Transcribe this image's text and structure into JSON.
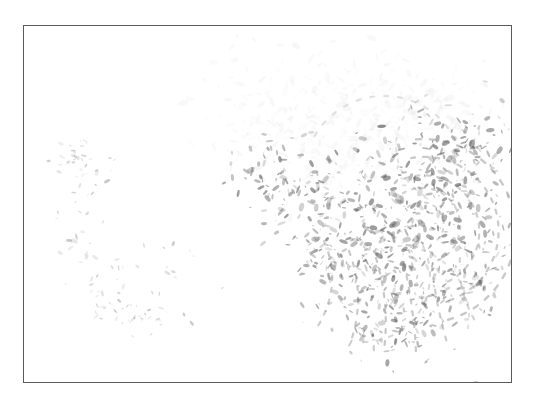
{
  "document": {
    "title": "Latent Fingerprint Impression",
    "kind": "scanned-image",
    "background_color": "#ffffff"
  },
  "frame": {
    "name": "image-border",
    "stroke_color": "#5a5a5e",
    "stroke_width_px": 1,
    "x": 23,
    "y": 25,
    "width": 489,
    "height": 358
  },
  "image_content": {
    "subject": "latent fingerprint ridge impression",
    "condition": "faded, low-contrast, partially developed",
    "ink_color": "#555558",
    "haze_color": "#d8d8dc",
    "coverage_note": "ridge detail concentrated in upper-right and center-right; left side nearly blank",
    "regions": [
      {
        "name": "upper-haze-cloud",
        "description": "diffuse light-gray mottled cloud near top center",
        "center_x": 320,
        "center_y": 95,
        "intensity": "very light"
      },
      {
        "name": "core-ridge-flow",
        "description": "curved arcing ridge fragments forming the print core",
        "center_x": 400,
        "center_y": 200,
        "intensity": "medium"
      },
      {
        "name": "lower-ridge-tails",
        "description": "vertical flowing ridge tails fading downward",
        "center_x": 360,
        "center_y": 285,
        "intensity": "medium-light"
      },
      {
        "name": "left-sparse-marks",
        "description": "isolated faint smudges and short strokes",
        "center_x": 110,
        "center_y": 230,
        "intensity": "very faint"
      }
    ]
  },
  "chart_data": {
    "type": "scatter",
    "xlabel": "",
    "ylabel": "",
    "xlim": [
      0,
      489
    ],
    "ylim": [
      0,
      358
    ],
    "grid": false,
    "legend": "none",
    "seed": 20240517,
    "series": [
      {
        "name": "haze-cloud",
        "color": "#d8d8dc",
        "count": 430,
        "blob_min_px": 3,
        "blob_max_px": 11,
        "opacity_min": 0.05,
        "opacity_max": 0.2,
        "clusters": [
          {
            "cx": 305,
            "cy": 55,
            "rx": 105,
            "ry": 45,
            "weight": 1.1
          },
          {
            "cx": 250,
            "cy": 95,
            "rx": 80,
            "ry": 45,
            "weight": 0.9
          },
          {
            "cx": 360,
            "cy": 100,
            "rx": 85,
            "ry": 45,
            "weight": 0.9
          },
          {
            "cx": 300,
            "cy": 135,
            "rx": 95,
            "ry": 40,
            "weight": 0.7
          },
          {
            "cx": 420,
            "cy": 75,
            "rx": 55,
            "ry": 40,
            "weight": 0.6
          }
        ]
      },
      {
        "name": "core-ridges",
        "color": "#5e5e62",
        "count": 560,
        "blob_min_px": 2,
        "blob_max_px": 9,
        "opacity_min": 0.18,
        "opacity_max": 0.62,
        "clusters": [
          {
            "cx": 390,
            "cy": 150,
            "rx": 75,
            "ry": 55,
            "weight": 1.2
          },
          {
            "cx": 420,
            "cy": 200,
            "rx": 70,
            "ry": 60,
            "weight": 1.3
          },
          {
            "cx": 355,
            "cy": 215,
            "rx": 55,
            "ry": 55,
            "weight": 1.0
          },
          {
            "cx": 300,
            "cy": 175,
            "rx": 60,
            "ry": 45,
            "weight": 0.8
          },
          {
            "cx": 440,
            "cy": 120,
            "rx": 50,
            "ry": 45,
            "weight": 0.9
          },
          {
            "cx": 255,
            "cy": 145,
            "rx": 50,
            "ry": 40,
            "weight": 0.55
          }
        ]
      },
      {
        "name": "ridge-tails",
        "color": "#5a5a5e",
        "count": 330,
        "blob_min_px": 2,
        "blob_max_px": 8,
        "opacity_min": 0.14,
        "opacity_max": 0.55,
        "clusters": [
          {
            "cx": 330,
            "cy": 255,
            "rx": 55,
            "ry": 50,
            "weight": 1.0
          },
          {
            "cx": 400,
            "cy": 270,
            "rx": 60,
            "ry": 55,
            "weight": 1.1
          },
          {
            "cx": 360,
            "cy": 300,
            "rx": 45,
            "ry": 40,
            "weight": 0.7
          },
          {
            "cx": 300,
            "cy": 230,
            "rx": 35,
            "ry": 35,
            "weight": 0.6
          },
          {
            "cx": 440,
            "cy": 245,
            "rx": 45,
            "ry": 45,
            "weight": 0.7
          }
        ]
      },
      {
        "name": "sparse-left-marks",
        "color": "#6a6a6e",
        "count": 120,
        "blob_min_px": 2,
        "blob_max_px": 7,
        "opacity_min": 0.07,
        "opacity_max": 0.35,
        "clusters": [
          {
            "cx": 60,
            "cy": 140,
            "rx": 35,
            "ry": 35,
            "weight": 0.8
          },
          {
            "cx": 80,
            "cy": 250,
            "rx": 45,
            "ry": 30,
            "weight": 0.7
          },
          {
            "cx": 110,
            "cy": 290,
            "rx": 55,
            "ry": 22,
            "weight": 0.8
          },
          {
            "cx": 150,
            "cy": 230,
            "rx": 45,
            "ry": 28,
            "weight": 0.5
          },
          {
            "cx": 55,
            "cy": 200,
            "rx": 30,
            "ry": 30,
            "weight": 0.4
          }
        ]
      }
    ],
    "ridge_arcs": [
      {
        "name": "arc-outer-right",
        "cx": 400,
        "cy": 205,
        "r": 92,
        "a0": -95,
        "a1": 80,
        "color": "#5e5e62",
        "opacity": 0.34,
        "width": 2.4,
        "dash": "5 9"
      },
      {
        "name": "arc-mid-right",
        "cx": 400,
        "cy": 205,
        "r": 74,
        "a0": -100,
        "a1": 75,
        "color": "#5e5e62",
        "opacity": 0.32,
        "width": 2.3,
        "dash": "4 8"
      },
      {
        "name": "arc-inner-right",
        "cx": 400,
        "cy": 205,
        "r": 56,
        "a0": -110,
        "a1": 70,
        "color": "#5e5e62",
        "opacity": 0.3,
        "width": 2.2,
        "dash": "4 7"
      },
      {
        "name": "arc-core-a",
        "cx": 398,
        "cy": 200,
        "r": 38,
        "a0": -120,
        "a1": 65,
        "color": "#5a5a5e",
        "opacity": 0.28,
        "width": 2.1,
        "dash": "3 7"
      },
      {
        "name": "arc-core-b",
        "cx": 398,
        "cy": 198,
        "r": 22,
        "a0": -130,
        "a1": 60,
        "color": "#5a5a5e",
        "opacity": 0.26,
        "width": 2.0,
        "dash": "3 6"
      },
      {
        "name": "arc-upper-sweep",
        "cx": 360,
        "cy": 150,
        "r": 80,
        "a0": -150,
        "a1": -20,
        "color": "#6a6a6e",
        "opacity": 0.2,
        "width": 2.2,
        "dash": "4 10"
      },
      {
        "name": "arc-top-delta",
        "cx": 430,
        "cy": 120,
        "r": 58,
        "a0": 120,
        "a1": 250,
        "color": "#6a6a6e",
        "opacity": 0.2,
        "width": 2.0,
        "dash": "3 8"
      },
      {
        "name": "arc-lower-left",
        "cx": 340,
        "cy": 250,
        "r": 66,
        "a0": -60,
        "a1": 95,
        "color": "#5e5e62",
        "opacity": 0.24,
        "width": 2.1,
        "dash": "4 9"
      },
      {
        "name": "arc-lower-tail",
        "cx": 375,
        "cy": 290,
        "r": 70,
        "a0": -120,
        "a1": 10,
        "color": "#5e5e62",
        "opacity": 0.2,
        "width": 2.0,
        "dash": "3 9"
      }
    ],
    "ridge_tails": [
      {
        "name": "tail-1",
        "x": 300,
        "y": 215,
        "dx": -6,
        "dy": 85,
        "bow": 22,
        "opacity": 0.3
      },
      {
        "name": "tail-2",
        "x": 325,
        "y": 225,
        "dx": 2,
        "dy": 90,
        "bow": 16,
        "opacity": 0.32
      },
      {
        "name": "tail-3",
        "x": 352,
        "y": 232,
        "dx": 8,
        "dy": 92,
        "bow": 10,
        "opacity": 0.34
      },
      {
        "name": "tail-4",
        "x": 380,
        "y": 238,
        "dx": 12,
        "dy": 88,
        "bow": 4,
        "opacity": 0.32
      },
      {
        "name": "tail-5",
        "x": 408,
        "y": 240,
        "dx": 16,
        "dy": 80,
        "bow": -4,
        "opacity": 0.3
      },
      {
        "name": "tail-6",
        "x": 436,
        "y": 232,
        "dx": 18,
        "dy": 68,
        "bow": -12,
        "opacity": 0.26
      }
    ]
  }
}
